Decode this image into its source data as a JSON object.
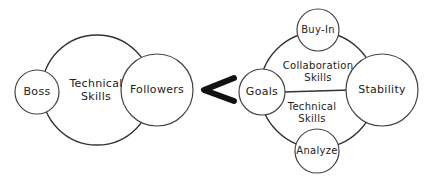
{
  "diagram": {
    "left_group": {
      "outer_circle": {
        "label_line1": "Technical",
        "label_line2": "Skills"
      },
      "nodes": [
        {
          "id": "boss",
          "label": "Boss"
        },
        {
          "id": "followers",
          "label": "Followers"
        }
      ]
    },
    "connector": {
      "symbol": "<",
      "meaning": "less-than"
    },
    "right_group": {
      "upper_region": {
        "label_line1": "Collaboration",
        "label_line2": "Skills"
      },
      "lower_region": {
        "label_line1": "Technical",
        "label_line2": "Skills"
      },
      "nodes": [
        {
          "id": "buy-in",
          "label": "Buy-In"
        },
        {
          "id": "goals",
          "label": "Goals"
        },
        {
          "id": "stability",
          "label": "Stability"
        },
        {
          "id": "analyze",
          "label": "Analyze"
        }
      ]
    },
    "colors": {
      "stroke": "#333333",
      "text": "#222222",
      "arrow": "#111111",
      "background": "#ffffff"
    }
  }
}
